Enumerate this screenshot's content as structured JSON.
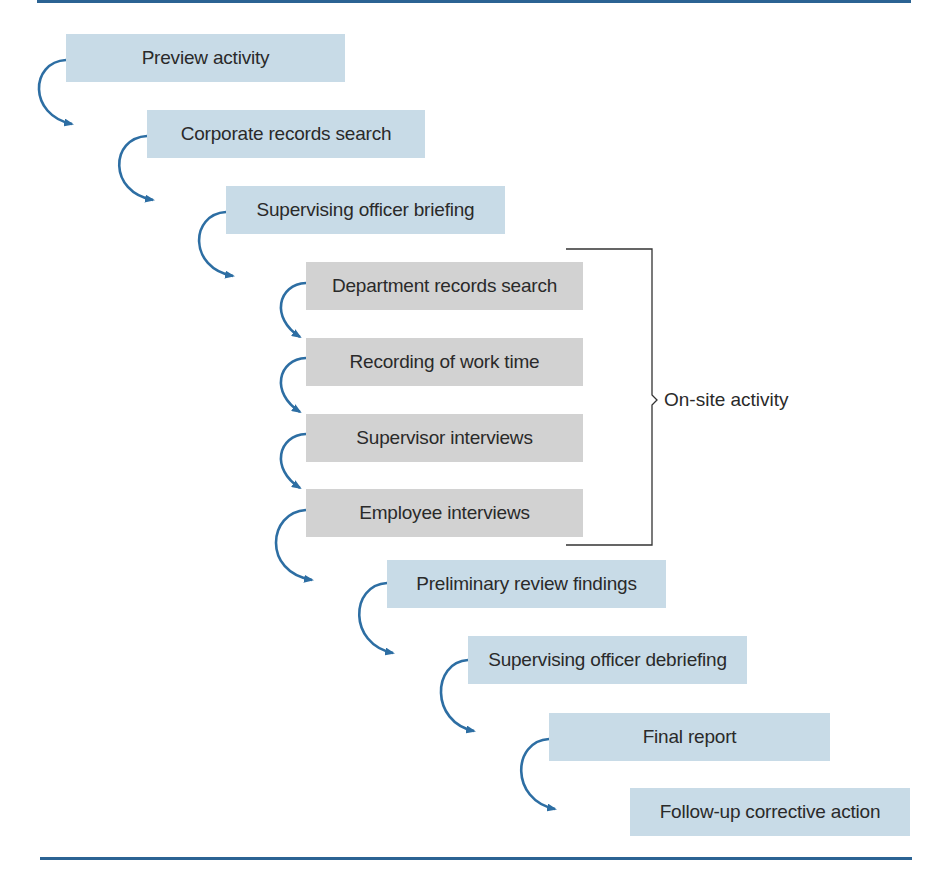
{
  "diagram": {
    "type": "process-flow",
    "steps": [
      {
        "label": "Preview activity",
        "style": "blue"
      },
      {
        "label": "Corporate records search",
        "style": "blue"
      },
      {
        "label": "Supervising officer briefing",
        "style": "blue"
      },
      {
        "label": "Department records search",
        "style": "gray"
      },
      {
        "label": "Recording of work time",
        "style": "gray"
      },
      {
        "label": "Supervisor interviews",
        "style": "gray"
      },
      {
        "label": "Employee interviews",
        "style": "gray"
      },
      {
        "label": "Preliminary review findings",
        "style": "blue"
      },
      {
        "label": "Supervising officer debriefing",
        "style": "blue"
      },
      {
        "label": "Final report",
        "style": "blue"
      },
      {
        "label": "Follow-up corrective action",
        "style": "blue"
      }
    ],
    "group": {
      "label": "On-site activity",
      "covers_steps": [
        4,
        5,
        6,
        7
      ]
    },
    "colors": {
      "rule": "#2b6393",
      "arrow": "#2d6ea3",
      "box_blue": "#c8dbe7",
      "box_gray": "#d2d2d2",
      "text": "#2a2a2a",
      "bracket": "#333333"
    }
  }
}
